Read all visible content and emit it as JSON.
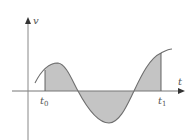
{
  "diagram": {
    "title": "",
    "axes": {
      "vertical_label": "v",
      "horizontal_label": "t"
    },
    "markers": [
      {
        "label": "t",
        "subscript": "0"
      },
      {
        "label": "t",
        "subscript": "1"
      }
    ],
    "colors": {
      "axis": "#777777",
      "curve": "#6e6e6e",
      "fill": "#c4c4c4",
      "label": "#555555"
    }
  }
}
